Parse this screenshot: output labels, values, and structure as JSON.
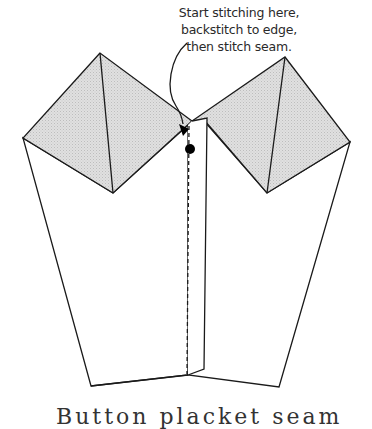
{
  "annotation": {
    "lines": [
      "Start stitching here,",
      "backstitch to edge,",
      "then stitch seam."
    ]
  },
  "caption": {
    "text": "Button placket seam"
  },
  "colors": {
    "stroke": "#1a1a1a",
    "fill_shaded": "#d9d9d9",
    "background": "#ffffff",
    "dot": "#000000"
  },
  "figure": {
    "left_panel": "left garment piece with folded shaded square",
    "right_panel": "right garment piece with folded shaded square",
    "center_flap": "overlapping flap with dashed stitching line",
    "marker": "start point dot with curved arrow"
  }
}
